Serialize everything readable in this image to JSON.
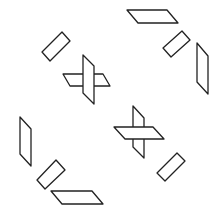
{
  "figure": {
    "width": 219,
    "height": 211,
    "background": "#ffffff",
    "stroke": "#222222",
    "shapes": [
      {
        "name": "top-parallelogram",
        "points": "127,10 167,10 178,23 138,23"
      },
      {
        "name": "top-right-rectangle",
        "points": "163,48 182,31 190,40 171,57"
      },
      {
        "name": "right-vertical-parallelogram",
        "points": "197,43 208,56 208,94 197,82"
      },
      {
        "name": "top-left-rectangle",
        "points": "42,52 62,32 70,41 50,61"
      },
      {
        "name": "cross1-horizontal",
        "points": "63,74 103,74 110,86 70,86"
      },
      {
        "name": "cross1-vertical",
        "points": "83,55 94,66 94,104 83,93"
      },
      {
        "name": "cross2-vertical",
        "points": "133,106 144,118 144,158 133,147"
      },
      {
        "name": "cross2-horizontal",
        "points": "114,127 153,127 164,139 125,139"
      },
      {
        "name": "left-vertical-parallelogram",
        "points": "20,117 31,129 31,166 20,154"
      },
      {
        "name": "bottom-left-rectangle",
        "points": "37,180 56,160 65,170 45,189"
      },
      {
        "name": "bottom-parallelogram",
        "points": "51,191 92,191 103,204 62,204"
      },
      {
        "name": "bottom-right-rectangle",
        "points": "157,173 177,153 185,161 165,181"
      }
    ]
  }
}
